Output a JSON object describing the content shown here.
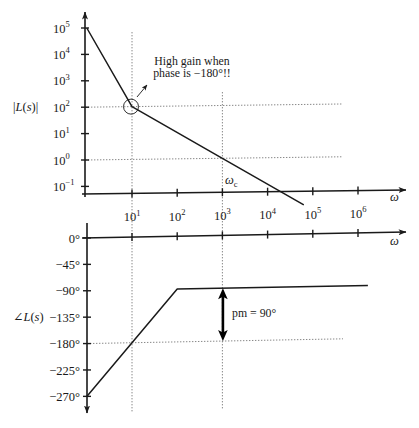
{
  "colors": {
    "line": "#1a1a1a",
    "gridline": "#7a7a7a",
    "background": "#ffffff"
  },
  "chart_data": [
    {
      "type": "line",
      "title": "",
      "xlabel": "ω",
      "ylabel": "|L(s)|",
      "xscale": "log",
      "yscale": "log",
      "xlim": [
        1,
        1000000
      ],
      "ylim": [
        0.05,
        100000
      ],
      "grid": false,
      "x_ticks": [
        10,
        100,
        1000,
        10000,
        100000,
        1000000
      ],
      "x_tick_labels": [
        {
          "base": "10",
          "exp": "1"
        },
        {
          "base": "10",
          "exp": "2"
        },
        {
          "base": "10",
          "exp": "3"
        },
        {
          "base": "10",
          "exp": "4"
        },
        {
          "base": "10",
          "exp": "5"
        },
        {
          "base": "10",
          "exp": "6"
        }
      ],
      "y_ticks": [
        100000,
        10000,
        1000,
        100,
        10,
        1,
        0.1
      ],
      "y_tick_labels": [
        {
          "base": "10",
          "exp": "5"
        },
        {
          "base": "10",
          "exp": "4"
        },
        {
          "base": "10",
          "exp": "3"
        },
        {
          "base": "10",
          "exp": "2"
        },
        {
          "base": "10",
          "exp": "1"
        },
        {
          "base": "10",
          "exp": "0"
        },
        {
          "base": "10",
          "exp": "−1"
        }
      ],
      "series": [
        {
          "name": "|L(jω)| (asymptotic)",
          "x": [
            1,
            10,
            1000,
            63096
          ],
          "y": [
            100000,
            100,
            1,
            0.0158
          ]
        }
      ],
      "reference_lines": [
        {
          "orientation": "vertical",
          "x": 10
        },
        {
          "orientation": "vertical",
          "x": 1000
        },
        {
          "orientation": "horizontal",
          "y": 100
        },
        {
          "orientation": "horizontal",
          "y": 1
        }
      ],
      "markers": [
        {
          "type": "circle",
          "x": 10,
          "y": 100
        }
      ],
      "annotations": [
        {
          "text_lines": [
            "High gain when",
            "phase is −180°!!"
          ],
          "points_to": {
            "x": 10,
            "y": 100
          }
        },
        {
          "label": {
            "base": "ω",
            "sub": "c"
          },
          "x": 1000,
          "meaning": "crossover frequency"
        }
      ]
    },
    {
      "type": "line",
      "title": "",
      "xlabel": "ω",
      "ylabel": "∠L(s)",
      "xscale": "log",
      "yscale": "linear",
      "xlim": [
        1,
        1000000
      ],
      "ylim": [
        -270,
        0
      ],
      "grid": false,
      "x_ticks": [
        10,
        100,
        1000,
        10000,
        100000,
        1000000
      ],
      "y_ticks": [
        0,
        -45,
        -90,
        -135,
        -180,
        -225,
        -270
      ],
      "y_tick_labels": [
        "0°",
        "−45°",
        "−90°",
        "−135°",
        "−180°",
        "−225°",
        "−270°"
      ],
      "series": [
        {
          "name": "∠L(jω) (asymptotic)",
          "x": [
            1,
            100,
            1660000
          ],
          "y": [
            -270,
            -90,
            -90
          ]
        }
      ],
      "reference_lines": [
        {
          "orientation": "vertical",
          "x": 10
        },
        {
          "orientation": "vertical",
          "x": 1000
        },
        {
          "orientation": "horizontal",
          "y": -180
        }
      ],
      "annotations": [
        {
          "type": "double-arrow",
          "x": 1000,
          "y_from": -90,
          "y_to": -180,
          "text": "pm = 90°"
        }
      ]
    }
  ]
}
